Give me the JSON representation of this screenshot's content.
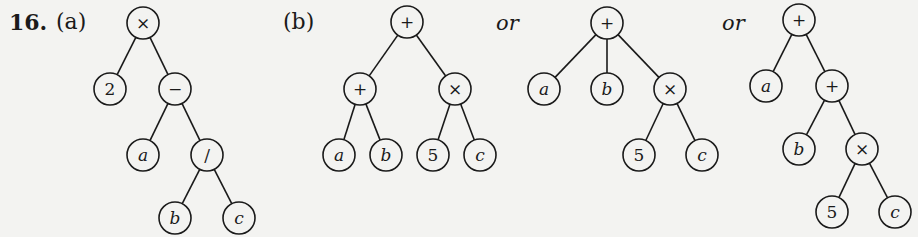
{
  "problem": {
    "number": "16.",
    "part_a_label": "(a)",
    "part_b_label": "(b)",
    "or_1": "or",
    "or_2": "or"
  },
  "trees": {
    "a": {
      "nodes": [
        {
          "id": "a0",
          "label": "×",
          "x": 143,
          "y": 23
        },
        {
          "id": "a1",
          "label": "2",
          "x": 110,
          "y": 89
        },
        {
          "id": "a2",
          "label": "−",
          "x": 175,
          "y": 89
        },
        {
          "id": "a3",
          "label": "a",
          "x": 143,
          "y": 155,
          "italic": true
        },
        {
          "id": "a4",
          "label": "/",
          "x": 207,
          "y": 155
        },
        {
          "id": "a5",
          "label": "b",
          "x": 175,
          "y": 218,
          "italic": true
        },
        {
          "id": "a6",
          "label": "c",
          "x": 239,
          "y": 218,
          "italic": true
        }
      ],
      "edges": [
        [
          "a0",
          "a1"
        ],
        [
          "a0",
          "a2"
        ],
        [
          "a2",
          "a3"
        ],
        [
          "a2",
          "a4"
        ],
        [
          "a4",
          "a5"
        ],
        [
          "a4",
          "a6"
        ]
      ]
    },
    "b": {
      "nodes": [
        {
          "id": "b0",
          "label": "+",
          "x": 407,
          "y": 22
        },
        {
          "id": "b1",
          "label": "+",
          "x": 360,
          "y": 89
        },
        {
          "id": "b2",
          "label": "×",
          "x": 455,
          "y": 89
        },
        {
          "id": "b3",
          "label": "a",
          "x": 339,
          "y": 155,
          "italic": true
        },
        {
          "id": "b4",
          "label": "b",
          "x": 386,
          "y": 155,
          "italic": true
        },
        {
          "id": "b5",
          "label": "5",
          "x": 433,
          "y": 155
        },
        {
          "id": "b6",
          "label": "c",
          "x": 480,
          "y": 155,
          "italic": true
        }
      ],
      "edges": [
        [
          "b0",
          "b1"
        ],
        [
          "b0",
          "b2"
        ],
        [
          "b1",
          "b3"
        ],
        [
          "b1",
          "b4"
        ],
        [
          "b2",
          "b5"
        ],
        [
          "b2",
          "b6"
        ]
      ]
    },
    "c": {
      "nodes": [
        {
          "id": "c0",
          "label": "+",
          "x": 607,
          "y": 23
        },
        {
          "id": "c1",
          "label": "a",
          "x": 544,
          "y": 89,
          "italic": true
        },
        {
          "id": "c2",
          "label": "b",
          "x": 607,
          "y": 89,
          "italic": true
        },
        {
          "id": "c3",
          "label": "×",
          "x": 670,
          "y": 89
        },
        {
          "id": "c4",
          "label": "5",
          "x": 639,
          "y": 155
        },
        {
          "id": "c5",
          "label": "c",
          "x": 702,
          "y": 155,
          "italic": true
        }
      ],
      "edges": [
        [
          "c0",
          "c1"
        ],
        [
          "c0",
          "c2"
        ],
        [
          "c0",
          "c3"
        ],
        [
          "c3",
          "c4"
        ],
        [
          "c3",
          "c5"
        ]
      ]
    },
    "d": {
      "nodes": [
        {
          "id": "d0",
          "label": "+",
          "x": 799,
          "y": 20
        },
        {
          "id": "d1",
          "label": "a",
          "x": 766,
          "y": 86,
          "italic": true
        },
        {
          "id": "d2",
          "label": "+",
          "x": 832,
          "y": 86
        },
        {
          "id": "d3",
          "label": "b",
          "x": 799,
          "y": 149,
          "italic": true
        },
        {
          "id": "d4",
          "label": "×",
          "x": 862,
          "y": 149
        },
        {
          "id": "d5",
          "label": "5",
          "x": 832,
          "y": 212
        },
        {
          "id": "d6",
          "label": "c",
          "x": 895,
          "y": 212,
          "italic": true
        }
      ],
      "edges": [
        [
          "d0",
          "d1"
        ],
        [
          "d0",
          "d2"
        ],
        [
          "d2",
          "d3"
        ],
        [
          "d2",
          "d4"
        ],
        [
          "d4",
          "d5"
        ],
        [
          "d4",
          "d6"
        ]
      ]
    }
  },
  "style": {
    "radius": 16,
    "stroke": "#1a1a1a",
    "fill": "#f3f3f1"
  }
}
